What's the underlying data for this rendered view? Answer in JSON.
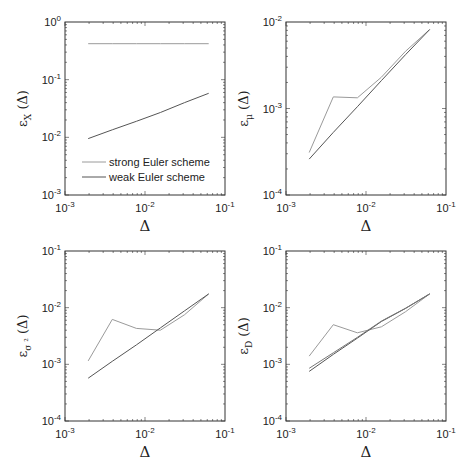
{
  "chart_data": [
    {
      "type": "line",
      "panel": "top-left",
      "ylabel": "ε_X (Δ)",
      "ylabel_main": "ε",
      "ylabel_sub": "X",
      "ylabel_tail": "(Δ)",
      "xlabel": "Δ",
      "xscale": "log",
      "yscale": "log",
      "xlim": [
        0.001,
        0.1
      ],
      "ylim": [
        0.001,
        1
      ],
      "xticks": [
        "10-3",
        "10-2",
        "10-1"
      ],
      "yticks": [
        "10-3",
        "10-2",
        "10-1",
        "100"
      ],
      "x": [
        0.00195,
        0.0039,
        0.0078,
        0.0156,
        0.03125,
        0.0625
      ],
      "series": [
        {
          "name": "strong Euler scheme",
          "color": "#9a9a9a",
          "values": [
            0.42,
            0.42,
            0.42,
            0.42,
            0.42,
            0.42
          ]
        },
        {
          "name": "weak Euler scheme",
          "color": "#555555",
          "values": [
            0.0095,
            0.0135,
            0.019,
            0.027,
            0.04,
            0.058
          ]
        }
      ],
      "legend": {
        "position": "lower-left",
        "entries": [
          "strong Euler scheme",
          "weak Euler scheme"
        ]
      }
    },
    {
      "type": "line",
      "panel": "top-right",
      "ylabel": "ε_μ (Δ)",
      "ylabel_main": "ε",
      "ylabel_sub": "μ",
      "ylabel_tail": "(Δ)",
      "xlabel": "Δ",
      "xscale": "log",
      "yscale": "log",
      "xlim": [
        0.001,
        0.1
      ],
      "ylim": [
        0.0001,
        0.01
      ],
      "xticks": [
        "10-3",
        "10-2",
        "10-1"
      ],
      "yticks": [
        "10-4",
        "10-3",
        "10-2"
      ],
      "x": [
        0.00195,
        0.0039,
        0.0078,
        0.0156,
        0.03125,
        0.0625
      ],
      "series": [
        {
          "name": "strong Euler scheme",
          "color": "#9a9a9a",
          "values": [
            0.00031,
            0.00136,
            0.00133,
            0.0023,
            0.0046,
            0.0082
          ]
        },
        {
          "name": "weak Euler scheme",
          "color": "#555555",
          "values": [
            0.00026,
            0.00053,
            0.00105,
            0.0021,
            0.0042,
            0.0082
          ]
        }
      ]
    },
    {
      "type": "line",
      "panel": "bottom-left",
      "ylabel": "ε_σ² (Δ)",
      "ylabel_main": "ε",
      "ylabel_sub": "σ ²",
      "ylabel_tail": "(Δ)",
      "xlabel": "Δ",
      "xscale": "log",
      "yscale": "log",
      "xlim": [
        0.001,
        0.1
      ],
      "ylim": [
        0.0001,
        0.1
      ],
      "xticks": [
        "10-3",
        "10-2",
        "10-1"
      ],
      "yticks": [
        "10-4",
        "10-3",
        "10-2",
        "10-1"
      ],
      "x": [
        0.00195,
        0.0039,
        0.0078,
        0.0156,
        0.03125,
        0.0625
      ],
      "series": [
        {
          "name": "strong Euler scheme",
          "color": "#9a9a9a",
          "values": [
            0.00115,
            0.0062,
            0.0043,
            0.004,
            0.0075,
            0.0175
          ]
        },
        {
          "name": "weak Euler scheme",
          "color": "#555555",
          "values": [
            0.00057,
            0.00113,
            0.0022,
            0.0044,
            0.0088,
            0.0175
          ]
        }
      ]
    },
    {
      "type": "line",
      "panel": "bottom-right",
      "ylabel": "ε_D (Δ)",
      "ylabel_main": "ε",
      "ylabel_sub": "D",
      "ylabel_tail": "(Δ)",
      "xlabel": "Δ",
      "xscale": "log",
      "yscale": "log",
      "xlim": [
        0.001,
        0.1
      ],
      "ylim": [
        0.0001,
        0.1
      ],
      "xticks": [
        "10-3",
        "10-2",
        "10-1"
      ],
      "yticks": [
        "10-4",
        "10-3",
        "10-2",
        "10-1"
      ],
      "x": [
        0.00195,
        0.0039,
        0.0078,
        0.0156,
        0.03125,
        0.0625
      ],
      "series": [
        {
          "name": "strong Euler scheme",
          "color": "#9a9a9a",
          "values": [
            0.0014,
            0.005,
            0.0036,
            0.0046,
            0.0085,
            0.0175
          ]
        },
        {
          "name": "weak Euler scheme",
          "color": "#555555",
          "values": [
            0.00075,
            0.0015,
            0.0029,
            0.0057,
            0.0097,
            0.0175
          ]
        },
        {
          "name": "weak Euler scheme (b)",
          "color": "#777777",
          "values": [
            0.00085,
            0.0016,
            0.003,
            0.0058,
            0.0098,
            0.0175
          ]
        }
      ]
    }
  ],
  "panels_layout": [
    {
      "x0": 65,
      "x1": 225,
      "y0": 22,
      "y1": 195
    },
    {
      "x0": 286,
      "x1": 446,
      "y0": 22,
      "y1": 195
    },
    {
      "x0": 65,
      "x1": 225,
      "y0": 251,
      "y1": 421
    },
    {
      "x0": 286,
      "x1": 446,
      "y0": 251,
      "y1": 421
    }
  ]
}
